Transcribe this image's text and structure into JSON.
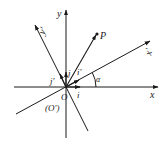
{
  "diagram": {
    "labels": {
      "x_axis": "x",
      "y_axis": "y",
      "x_prime_axis": "x'",
      "y_prime_axis": "y'",
      "point": "P",
      "angle": "α",
      "origin": "O",
      "origin_prime": "(O')",
      "unit_i": "i",
      "unit_j": "j",
      "unit_i_prime": "i'",
      "unit_j_prime": "j'"
    },
    "colors": {
      "ink": "#1a1a1a",
      "background": "#ffffff"
    }
  }
}
